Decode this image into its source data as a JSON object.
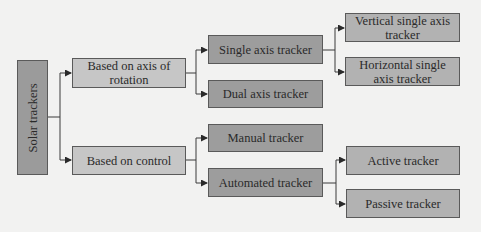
{
  "diagram": {
    "type": "tree",
    "colors": {
      "background": "#f2f2f1",
      "root_fill": "#9b9b9b",
      "level1_fill": "#c6c6c6",
      "level2_fill": "#9d9d9d",
      "level3_fill": "#b2b2b2",
      "border": "#5a5a5a",
      "connector": "#3a3a3a"
    },
    "root": {
      "label": "Solar trackers"
    },
    "nodes": {
      "axis_of_rotation": "Based on axis of rotation",
      "control": "Based on control",
      "single_axis": "Single axis tracker",
      "dual_axis": "Dual axis tracker",
      "manual": "Manual tracker",
      "automated": "Automated tracker",
      "vertical_single_axis": "Vertical single axis tracker",
      "horizontal_single_axis": "Horizontal single axis tracker",
      "active": "Active tracker",
      "passive": "Passive tracker"
    },
    "edges": [
      [
        "Solar trackers",
        "Based on axis of rotation"
      ],
      [
        "Solar trackers",
        "Based on control"
      ],
      [
        "Based on axis of rotation",
        "Single axis tracker"
      ],
      [
        "Based on axis of rotation",
        "Dual axis tracker"
      ],
      [
        "Single axis tracker",
        "Vertical single axis tracker"
      ],
      [
        "Single axis tracker",
        "Horizontal single axis tracker"
      ],
      [
        "Based on control",
        "Manual tracker"
      ],
      [
        "Based on control",
        "Automated tracker"
      ],
      [
        "Automated tracker",
        "Active tracker"
      ],
      [
        "Automated tracker",
        "Passive tracker"
      ]
    ]
  }
}
